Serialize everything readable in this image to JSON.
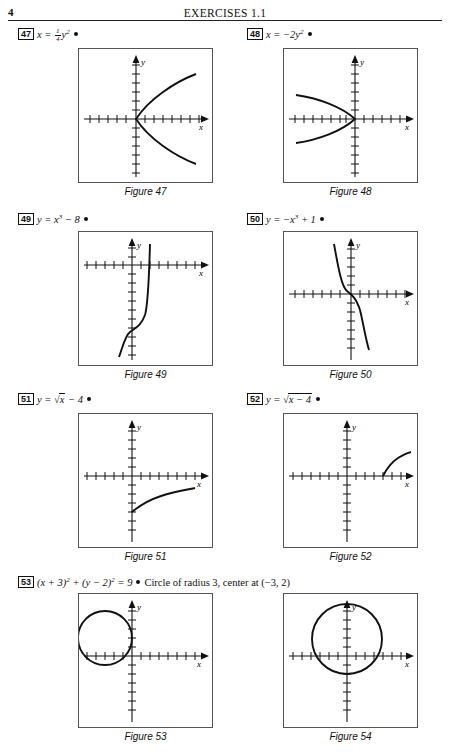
{
  "header": {
    "page_number": "4",
    "title": "EXERCISES 1.1"
  },
  "problems": [
    {
      "number": "47",
      "equation_html": "x = <span class=\"frac\"><span class=\"nu\">1</span><span class=\"de\">4</span></span>y<sup>2</sup>",
      "answer": ""
    },
    {
      "number": "48",
      "equation_html": "x = &minus;2y<sup>2</sup>",
      "answer": ""
    },
    {
      "number": "49",
      "equation_html": "y = x<sup>3</sup> &minus; 8",
      "answer": ""
    },
    {
      "number": "50",
      "equation_html": "y = &minus;x<sup>3</sup> + 1",
      "answer": ""
    },
    {
      "number": "51",
      "equation_html": "y = <span class=\"radsign\">&radic;</span><span class=\"rad\">x</span> &minus; 4",
      "answer": ""
    },
    {
      "number": "52",
      "equation_html": "y = <span class=\"radsign\">&radic;</span><span class=\"rad\">x &minus; 4</span>",
      "answer": ""
    },
    {
      "number": "53",
      "equation_html": "(x + 3)<sup>2</sup> + (y &minus; 2)<sup>2</sup> = 9",
      "answer": "Circle of radius 3, center at (&minus;3, 2)"
    }
  ],
  "figures": [
    {
      "caption": "Figure 47"
    },
    {
      "caption": "Figure 48"
    },
    {
      "caption": "Figure 49"
    },
    {
      "caption": "Figure 50"
    },
    {
      "caption": "Figure 51"
    },
    {
      "caption": "Figure 52"
    },
    {
      "caption": "Figure 53"
    },
    {
      "caption": "Figure 54"
    }
  ],
  "axis_labels": {
    "x": "x",
    "y": "y"
  },
  "chart_data": [
    {
      "type": "line",
      "id": "figure-47",
      "title": "Figure 47",
      "equation": "x = (1/4)y^2",
      "xlabel": "x",
      "ylabel": "y",
      "xlim": [
        -7,
        7
      ],
      "ylim": [
        -7,
        7
      ],
      "grid": false,
      "ticks": "unit tick marks on both axes",
      "description": "Parabola opening to the right, vertex at origin",
      "points": [
        [
          4.0,
          -4
        ],
        [
          2.25,
          -3
        ],
        [
          1.0,
          -2
        ],
        [
          0.25,
          -1
        ],
        [
          0,
          0
        ],
        [
          0.25,
          1
        ],
        [
          1.0,
          2
        ],
        [
          2.25,
          3
        ],
        [
          4.0,
          4
        ]
      ]
    },
    {
      "type": "line",
      "id": "figure-48",
      "title": "Figure 48",
      "equation": "x = -2y^2",
      "xlabel": "x",
      "ylabel": "y",
      "xlim": [
        -7,
        7
      ],
      "ylim": [
        -7,
        7
      ],
      "grid": false,
      "ticks": "unit tick marks on both axes",
      "description": "Parabola opening to the left, vertex at origin",
      "points": [
        [
          -4.5,
          -1.5
        ],
        [
          -2,
          -1
        ],
        [
          -0.5,
          -0.5
        ],
        [
          0,
          0
        ],
        [
          -0.5,
          0.5
        ],
        [
          -2,
          1
        ],
        [
          -4.5,
          1.5
        ]
      ]
    },
    {
      "type": "line",
      "id": "figure-49",
      "title": "Figure 49",
      "equation": "y = x^3 - 8",
      "xlabel": "x",
      "ylabel": "y",
      "xlim": [
        -7,
        7
      ],
      "ylim": [
        -7,
        7
      ],
      "grid": false,
      "ticks": "unit tick marks on both axes",
      "description": "Cubic curve shifted down 8, x-intercept at x = 2",
      "points": [
        [
          -0.5,
          -8.1
        ],
        [
          0,
          -8
        ],
        [
          0.5,
          -7.9
        ],
        [
          1,
          -7
        ],
        [
          1.5,
          -4.6
        ],
        [
          2,
          0
        ],
        [
          2.3,
          4.2
        ],
        [
          2.5,
          7.6
        ]
      ]
    },
    {
      "type": "line",
      "id": "figure-50",
      "title": "Figure 50",
      "equation": "y = -x^3 + 1",
      "xlabel": "x",
      "ylabel": "y",
      "xlim": [
        -7,
        7
      ],
      "ylim": [
        -7,
        7
      ],
      "grid": false,
      "ticks": "unit tick marks on both axes",
      "description": "Decreasing cubic, y-intercept 1, x-intercept at x = 1",
      "points": [
        [
          -2,
          9
        ],
        [
          -1.5,
          4.4
        ],
        [
          -1,
          2
        ],
        [
          -0.5,
          1.1
        ],
        [
          0,
          1
        ],
        [
          0.5,
          0.9
        ],
        [
          1,
          0
        ],
        [
          1.5,
          -2.4
        ],
        [
          2,
          -7
        ]
      ]
    },
    {
      "type": "line",
      "id": "figure-51",
      "title": "Figure 51",
      "equation": "y = sqrt(x) - 4",
      "xlabel": "x",
      "ylabel": "y",
      "xlim": [
        -7,
        7
      ],
      "ylim": [
        -7,
        7
      ],
      "grid": false,
      "ticks": "unit tick marks on both axes",
      "description": "Square root curve starting at (0, -4), increasing",
      "points": [
        [
          0,
          -4
        ],
        [
          1,
          -3
        ],
        [
          2,
          -2.59
        ],
        [
          3,
          -2.27
        ],
        [
          4,
          -2
        ],
        [
          5,
          -1.76
        ],
        [
          6,
          -1.55
        ]
      ]
    },
    {
      "type": "line",
      "id": "figure-52",
      "title": "Figure 52",
      "equation": "y = sqrt(x - 4)",
      "xlabel": "x",
      "ylabel": "y",
      "xlim": [
        -7,
        7
      ],
      "ylim": [
        -7,
        7
      ],
      "grid": false,
      "ticks": "unit tick marks on both axes",
      "description": "Square root curve starting at (4, 0), increasing",
      "points": [
        [
          4,
          0
        ],
        [
          5,
          1
        ],
        [
          6,
          1.41
        ],
        [
          7,
          1.73
        ]
      ]
    },
    {
      "type": "line",
      "id": "figure-53",
      "title": "Figure 53",
      "equation": "(x + 3)^2 + (y - 2)^2 = 9",
      "xlabel": "x",
      "ylabel": "y",
      "xlim": [
        -7,
        7
      ],
      "ylim": [
        -7,
        7
      ],
      "grid": false,
      "ticks": "unit tick marks on both axes",
      "description": "Circle, center (-3, 2), radius 3, tangent to the y-axis",
      "center": [
        -3,
        2
      ],
      "radius": 3
    },
    {
      "type": "line",
      "id": "figure-54",
      "title": "Figure 54",
      "equation": "",
      "xlabel": "x",
      "ylabel": "y",
      "xlim": [
        -7,
        7
      ],
      "ylim": [
        -7,
        7
      ],
      "grid": false,
      "ticks": "unit tick marks on both axes",
      "description": "Circle, center (0, 3), radius 4",
      "center": [
        0,
        3
      ],
      "radius": 4
    }
  ]
}
